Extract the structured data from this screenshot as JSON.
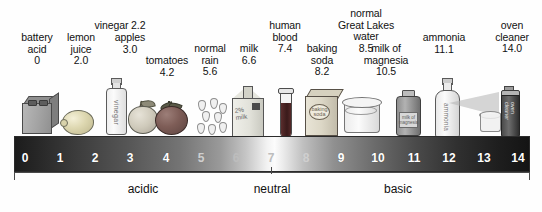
{
  "diagram": {
    "type": "ph-scale"
  },
  "scale": {
    "ticks": [
      "0",
      "1",
      "2",
      "3",
      "4",
      "5",
      "6",
      "7",
      "8",
      "9",
      "10",
      "11",
      "12",
      "13",
      "14"
    ],
    "min": 0,
    "max": 14,
    "neutral_value": "7"
  },
  "zones": [
    {
      "label": "acidic",
      "range": [
        0,
        6.5
      ]
    },
    {
      "label": "neutral",
      "range": [
        6.5,
        7.5
      ]
    },
    {
      "label": "basic",
      "range": [
        7.5,
        14
      ]
    }
  ],
  "substances": [
    {
      "name": "battery acid",
      "lines": [
        "battery",
        "acid",
        "0"
      ],
      "ph": "0",
      "icon": "battery-icon"
    },
    {
      "name": "lemon juice",
      "lines": [
        "lemon",
        "juice",
        "2.0"
      ],
      "ph": "2.0",
      "icon": "lemon-icon"
    },
    {
      "name": "vinegar",
      "lines": [
        "vinegar 2.2"
      ],
      "ph": "2.2",
      "icon": "vinegar-bottle-icon",
      "bottle_label": "vinegar"
    },
    {
      "name": "apples",
      "lines": [
        "apples",
        "3.0"
      ],
      "ph": "3.0",
      "icon": "apple-icon"
    },
    {
      "name": "tomatoes",
      "lines": [
        "tomatoes",
        "4.2"
      ],
      "ph": "4.2",
      "icon": "tomato-icon"
    },
    {
      "name": "normal rain",
      "lines": [
        "normal",
        "rain",
        "5.6"
      ],
      "ph": "5.6",
      "icon": "raindrops-icon"
    },
    {
      "name": "milk",
      "lines": [
        "milk",
        "6.6"
      ],
      "ph": "6.6",
      "icon": "milk-carton-icon",
      "carton_label": "2% milk"
    },
    {
      "name": "human blood",
      "lines": [
        "human",
        "blood",
        "7.4"
      ],
      "ph": "7.4",
      "icon": "test-tube-icon"
    },
    {
      "name": "baking soda",
      "lines": [
        "baking",
        "soda",
        "8.2"
      ],
      "ph": "8.2",
      "icon": "baking-soda-box-icon",
      "box_label": "baking soda"
    },
    {
      "name": "normal Great Lakes water",
      "lines": [
        "normal",
        "Great Lakes",
        "water",
        "8.5"
      ],
      "ph": "8.5",
      "icon": "beaker-icon"
    },
    {
      "name": "milk of magnesia",
      "lines": [
        "milk of",
        "magnesia",
        "10.5"
      ],
      "ph": "10.5",
      "icon": "medicine-bottle-icon",
      "bottle_label": "milk of magnesia"
    },
    {
      "name": "ammonia",
      "lines": [
        "ammonia",
        "11.1"
      ],
      "ph": "11.1",
      "icon": "ammonia-bottle-icon",
      "bottle_label": "ammonia"
    },
    {
      "name": "oven cleaner",
      "lines": [
        "oven",
        "cleaner",
        "14.0"
      ],
      "ph": "14.0",
      "icon": "spray-can-icon",
      "can_label": "oven cleaner"
    }
  ],
  "colors": {
    "background": "#fefefe",
    "text": "#111111",
    "bar_acid_end": "#1c1c1c",
    "bar_neutral": "#fcfcfc",
    "bar_base_end": "#141414",
    "tick_text": "#ffffff",
    "bracket": "#4a4a4a"
  }
}
